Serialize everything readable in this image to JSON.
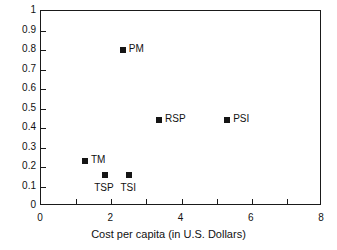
{
  "chart_data": {
    "type": "scatter",
    "title": "",
    "xlabel": "Cost per capita (in U.S. Dollars)",
    "ylabel": "",
    "xlim": [
      0,
      8
    ],
    "ylim": [
      0,
      1
    ],
    "grid": false,
    "legend": "none",
    "x_major_ticks": [
      0,
      2,
      4,
      6,
      8
    ],
    "x_minor_ticks": [
      1,
      3,
      5,
      7
    ],
    "x_tick_labels": [
      "0",
      "2",
      "4",
      "6",
      "8"
    ],
    "y_ticks": [
      0,
      0.1,
      0.2,
      0.3,
      0.4,
      0.5,
      0.6,
      0.7,
      0.8,
      0.9,
      1
    ],
    "y_tick_labels": [
      "0",
      "0.1",
      "0.2",
      "0.3",
      "0.4",
      "0.5",
      "0.6",
      "0.7",
      "0.8",
      "0.9",
      "1"
    ],
    "marker_color": "#151515",
    "axis_color": "#1a1a1a",
    "points": [
      {
        "label": "TM",
        "x": 1.25,
        "y": 0.23,
        "label_pos": "right"
      },
      {
        "label": "TSP",
        "x": 1.82,
        "y": 0.16,
        "label_pos": "below"
      },
      {
        "label": "TSI",
        "x": 2.51,
        "y": 0.16,
        "label_pos": "below"
      },
      {
        "label": "PM",
        "x": 2.33,
        "y": 0.8,
        "label_pos": "right"
      },
      {
        "label": "RSP",
        "x": 3.36,
        "y": 0.44,
        "label_pos": "right"
      },
      {
        "label": "PSI",
        "x": 5.3,
        "y": 0.44,
        "label_pos": "right"
      }
    ]
  }
}
